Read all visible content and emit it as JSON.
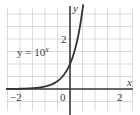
{
  "chart_data": {
    "type": "line",
    "title": "",
    "xlabel": "x",
    "ylabel": "y",
    "xlim": [
      -2.5,
      2.5
    ],
    "ylim": [
      -0.85,
      3.3
    ],
    "grid": true,
    "grid_step": 0.5,
    "x_ticks": [
      {
        "value": -2,
        "label": "−2"
      },
      {
        "value": 0,
        "label": "0"
      },
      {
        "value": 2,
        "label": "2"
      }
    ],
    "y_ticks": [
      {
        "value": 2,
        "label": "2"
      }
    ],
    "series": [
      {
        "name": "y = 10^x",
        "function": "10^x",
        "x": [
          -2.5,
          -2,
          -1.5,
          -1,
          -0.5,
          -0.25,
          0,
          0.1,
          0.2,
          0.3,
          0.4,
          0.5
        ],
        "values": [
          0.003,
          0.01,
          0.032,
          0.1,
          0.316,
          0.562,
          1,
          1.259,
          1.585,
          1.995,
          2.512,
          3.162
        ]
      }
    ],
    "annotations": [
      {
        "text_base": "y = 10",
        "text_sup": "x",
        "x": -1.6,
        "y": 1.3
      }
    ],
    "colors": {
      "curve": "#333333",
      "axis": "#3a3a3a",
      "grid": "#d2d2d2"
    }
  }
}
